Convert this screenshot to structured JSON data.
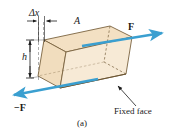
{
  "figure": {
    "caption": "(a)",
    "background_color": "#ffffff",
    "labels": {
      "delta_x": "Δx",
      "height": "h",
      "area": "A",
      "force_positive": "F",
      "force_negative": "−F",
      "fixed_face": "Fixed face"
    },
    "colors": {
      "arrow_blue": "#3a9fd0",
      "top_face": "#f3e0c3",
      "front_face": "#f7ead6",
      "right_face": "#e8d2ae",
      "outline": "#7a6340",
      "text": "#1a1a1a",
      "dashed_line": "#8a8a8a",
      "dimension_line": "#1a1a1a"
    },
    "elements": {
      "block_description": "sheared rectangular parallelepiped",
      "dimension_delta_x": "horizontal shear offset at top",
      "dimension_h": "vertical height of block",
      "area_label": "top face area A",
      "force_top": "force F applied to top face, pointing right",
      "force_bottom": "reaction force −F on bottom face, pointing left",
      "fixed_face_note": "bottom face is held fixed"
    }
  }
}
